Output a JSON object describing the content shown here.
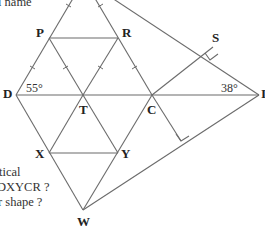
{
  "diagram": {
    "labels": {
      "D": "D",
      "P": "P",
      "R": "R",
      "S": "S",
      "T": "T",
      "C": "C",
      "X": "X",
      "Y": "Y",
      "W": "W",
      "I": "I"
    },
    "angles": {
      "at_D": "55°",
      "at_I": "38°"
    },
    "text_fragments": {
      "top": "l name",
      "line1": "tical",
      "line2": "DXYCR ?",
      "line3": "r shape ?"
    },
    "colors": {
      "line": "#6b6b6b",
      "label": "#222222",
      "background": "#ffffff"
    }
  }
}
